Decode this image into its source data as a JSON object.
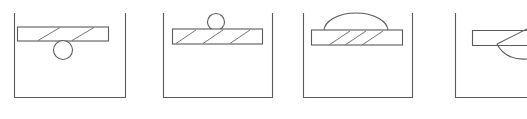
{
  "figure": {
    "title": "",
    "background_color": "#ffffff",
    "line_color": "#5a5a5a",
    "width": 527,
    "height": 119,
    "panel_count": 4
  },
  "panels": [
    {
      "id": "panel-1",
      "label": "",
      "container": {
        "name": "open-top-container",
        "left": 14,
        "right": 126,
        "top": 13,
        "bottom": 98,
        "open_side": "top"
      },
      "bar": {
        "name": "hatched-bar",
        "left": 17,
        "right": 108,
        "top": 27,
        "bottom": 41,
        "hatch_count": 2,
        "hatch_direction": "forward-slash"
      },
      "ball": {
        "name": "ball",
        "cx": 63,
        "cy": 50,
        "r": 9.5,
        "position": "below-bar"
      },
      "dome": null
    },
    {
      "id": "panel-2",
      "label": "",
      "container": {
        "name": "open-top-container",
        "left": 163,
        "right": 273,
        "top": 13,
        "bottom": 98,
        "open_side": "top"
      },
      "bar": {
        "name": "hatched-bar",
        "left": 172,
        "right": 262,
        "top": 29,
        "bottom": 44,
        "hatch_count": 3,
        "hatch_direction": "forward-slash"
      },
      "ball": {
        "name": "ball",
        "cx": 216,
        "cy": 22,
        "r": 8.5,
        "position": "on-top-of-bar"
      },
      "dome": null
    },
    {
      "id": "panel-3",
      "label": "",
      "container": {
        "name": "open-top-container",
        "left": 303,
        "right": 413,
        "top": 13,
        "bottom": 98,
        "open_side": "top"
      },
      "bar": {
        "name": "hatched-bar",
        "left": 311,
        "right": 402,
        "top": 30,
        "bottom": 45,
        "hatch_count": 3,
        "hatch_direction": "forward-slash"
      },
      "ball": null,
      "dome": {
        "name": "dome-arc",
        "cx": 356,
        "cy": 31,
        "rx": 32,
        "ry": 18,
        "position": "over-bar"
      }
    },
    {
      "id": "panel-4",
      "label": "",
      "container": {
        "name": "open-top-container",
        "left": 455,
        "right": 527,
        "top": 13,
        "bottom": 98,
        "open_side": "top",
        "clipped": "right-edge"
      },
      "bar": {
        "name": "hatched-bar",
        "left": 472,
        "right": 527,
        "top": 30,
        "bottom": 46,
        "hatch_count": 0,
        "hatch_direction": "none"
      },
      "ball": null,
      "dome": {
        "name": "partial-arc",
        "cx": 510,
        "cy": 38,
        "rx": 22,
        "ry": 20,
        "position": "clipped-right"
      }
    }
  ]
}
